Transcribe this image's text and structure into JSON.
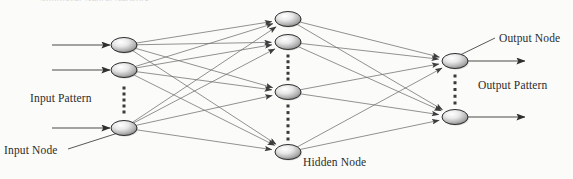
{
  "figure": {
    "kind": "neural-network-diagram",
    "width": 573,
    "height": 179,
    "background_color": "#fbfbf9",
    "ink_color": "#3a3a3a",
    "edge_color": "#6e6e6e",
    "node_fill_light": "#f2f2f2",
    "node_fill_dark": "#8a8a8a",
    "node_stroke": "#2e2e2e",
    "top_cut_caption": "Multilayer Neural Network"
  },
  "labels": {
    "input_pattern": "Input Pattern",
    "input_node": "Input Node",
    "hidden_node": "Hidden Node",
    "output_node": "Output Node",
    "output_pattern": "Output Pattern"
  },
  "layers": [
    {
      "id": "input",
      "name": "Input Layer",
      "x": 124,
      "node_count_drawn": 3,
      "nodes": [
        {
          "id": "i1",
          "cx": 124,
          "cy": 45
        },
        {
          "id": "i2",
          "cx": 124,
          "cy": 70
        },
        {
          "id": "i3",
          "cx": 124,
          "cy": 128
        }
      ],
      "ellipsis": [
        {
          "cx": 124,
          "y_from": 88,
          "y_to": 112,
          "dots": 5
        }
      ]
    },
    {
      "id": "hidden",
      "name": "Hidden Layer",
      "x": 288,
      "node_count_drawn": 4,
      "nodes": [
        {
          "id": "h1",
          "cx": 288,
          "cy": 19
        },
        {
          "id": "h2",
          "cx": 288,
          "cy": 42
        },
        {
          "id": "h3",
          "cx": 288,
          "cy": 92
        },
        {
          "id": "h4",
          "cx": 288,
          "cy": 152
        }
      ],
      "ellipsis": [
        {
          "cx": 288,
          "y_from": 56,
          "y_to": 79,
          "dots": 5
        },
        {
          "cx": 288,
          "y_from": 106,
          "y_to": 139,
          "dots": 6
        }
      ]
    },
    {
      "id": "output",
      "name": "Output Layer",
      "x": 455,
      "node_count_drawn": 2,
      "nodes": [
        {
          "id": "o1",
          "cx": 455,
          "cy": 61
        },
        {
          "id": "o2",
          "cx": 455,
          "cy": 117
        }
      ],
      "ellipsis": [
        {
          "cx": 455,
          "y_from": 76,
          "y_to": 103,
          "dots": 5
        }
      ]
    }
  ],
  "node_shape": {
    "rx": 13,
    "ry": 7.5
  },
  "input_arrows": [
    {
      "x1": 52,
      "y1": 45,
      "x2": 110,
      "y2": 45
    },
    {
      "x1": 52,
      "y1": 70,
      "x2": 110,
      "y2": 70
    },
    {
      "x1": 52,
      "y1": 128,
      "x2": 110,
      "y2": 128
    }
  ],
  "output_arrows": [
    {
      "x1": 468,
      "y1": 61,
      "x2": 525,
      "y2": 61
    },
    {
      "x1": 468,
      "y1": 117,
      "x2": 525,
      "y2": 117
    }
  ],
  "leader_lines": [
    {
      "id": "input-node-leader",
      "x1": 68,
      "y1": 149,
      "x2": 118,
      "y2": 133
    },
    {
      "id": "output-node-leader",
      "x1": 495,
      "y1": 38,
      "x2": 458,
      "y2": 56
    }
  ],
  "connections": {
    "input_to_hidden": [
      [
        "i1",
        "h1"
      ],
      [
        "i1",
        "h2"
      ],
      [
        "i1",
        "h3"
      ],
      [
        "i1",
        "h4"
      ],
      [
        "i2",
        "h1"
      ],
      [
        "i2",
        "h2"
      ],
      [
        "i2",
        "h3"
      ],
      [
        "i2",
        "h4"
      ],
      [
        "i3",
        "h1"
      ],
      [
        "i3",
        "h2"
      ],
      [
        "i3",
        "h3"
      ],
      [
        "i3",
        "h4"
      ]
    ],
    "hidden_to_output": [
      [
        "h1",
        "o1"
      ],
      [
        "h1",
        "o2"
      ],
      [
        "h2",
        "o1"
      ],
      [
        "h2",
        "o2"
      ],
      [
        "h3",
        "o1"
      ],
      [
        "h3",
        "o2"
      ],
      [
        "h4",
        "o1"
      ],
      [
        "h4",
        "o2"
      ]
    ]
  }
}
